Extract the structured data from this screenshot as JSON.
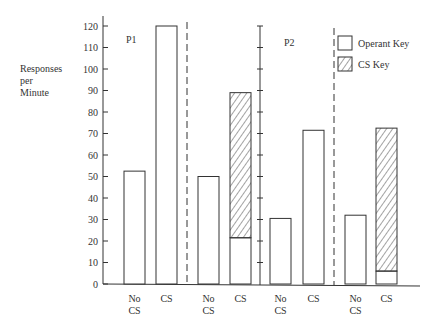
{
  "chart_data": {
    "type": "bar",
    "title": "",
    "ylabel": "Responses per Minute",
    "ylabel_lines": [
      "Responses",
      "per",
      "Minute"
    ],
    "xlabel": "",
    "ylim": [
      0,
      120
    ],
    "yticks": [
      0,
      10,
      20,
      30,
      40,
      50,
      60,
      70,
      80,
      90,
      100,
      110,
      120
    ],
    "grid": false,
    "legend": {
      "position": "top-right",
      "entries": [
        {
          "label": "Operant Key",
          "style": "open"
        },
        {
          "label": "CS Key",
          "style": "hatched"
        }
      ]
    },
    "panels": [
      {
        "label": "P1",
        "conditions": [
          {
            "name": "single-key",
            "bars": [
              {
                "category": "No CS",
                "operant_key": 52.5,
                "cs_key": 0
              },
              {
                "category": "CS",
                "operant_key": 120,
                "cs_key": 0
              }
            ]
          },
          {
            "name": "two-key",
            "bars": [
              {
                "category": "No CS",
                "operant_key": 50,
                "cs_key": 0
              },
              {
                "category": "CS",
                "operant_key": 21.5,
                "cs_key": 67.5
              }
            ]
          }
        ]
      },
      {
        "label": "P2",
        "conditions": [
          {
            "name": "single-key",
            "bars": [
              {
                "category": "No CS",
                "operant_key": 30.5,
                "cs_key": 0
              },
              {
                "category": "CS",
                "operant_key": 71.5,
                "cs_key": 0
              }
            ]
          },
          {
            "name": "two-key",
            "bars": [
              {
                "category": "No CS",
                "operant_key": 32,
                "cs_key": 0
              },
              {
                "category": "CS",
                "operant_key": 6,
                "cs_key": 66.5
              }
            ]
          }
        ]
      }
    ],
    "categories": [
      "No CS",
      "CS",
      "No CS",
      "CS",
      "No CS",
      "CS",
      "No CS",
      "CS"
    ],
    "series": [
      {
        "name": "Operant Key",
        "values": [
          52.5,
          120,
          50,
          21.5,
          30.5,
          71.5,
          32,
          6
        ]
      },
      {
        "name": "CS Key",
        "values": [
          0,
          0,
          0,
          67.5,
          0,
          0,
          0,
          66.5
        ]
      }
    ]
  },
  "labels": {
    "ylabel": [
      "Responses",
      "per",
      "Minute"
    ],
    "panel1": "P1",
    "panel2": "P2",
    "legend_operant": "Operant Key",
    "legend_cs": "CS Key",
    "x": [
      [
        "No",
        "CS"
      ],
      [
        "CS"
      ],
      [
        "No",
        "CS"
      ],
      [
        "CS"
      ],
      [
        "No",
        "CS"
      ],
      [
        "CS"
      ],
      [
        "No",
        "CS"
      ],
      [
        "CS"
      ]
    ],
    "yticks": [
      "0",
      "10",
      "20",
      "30",
      "40",
      "50",
      "60",
      "70",
      "80",
      "90",
      "100",
      "110",
      "120"
    ]
  }
}
